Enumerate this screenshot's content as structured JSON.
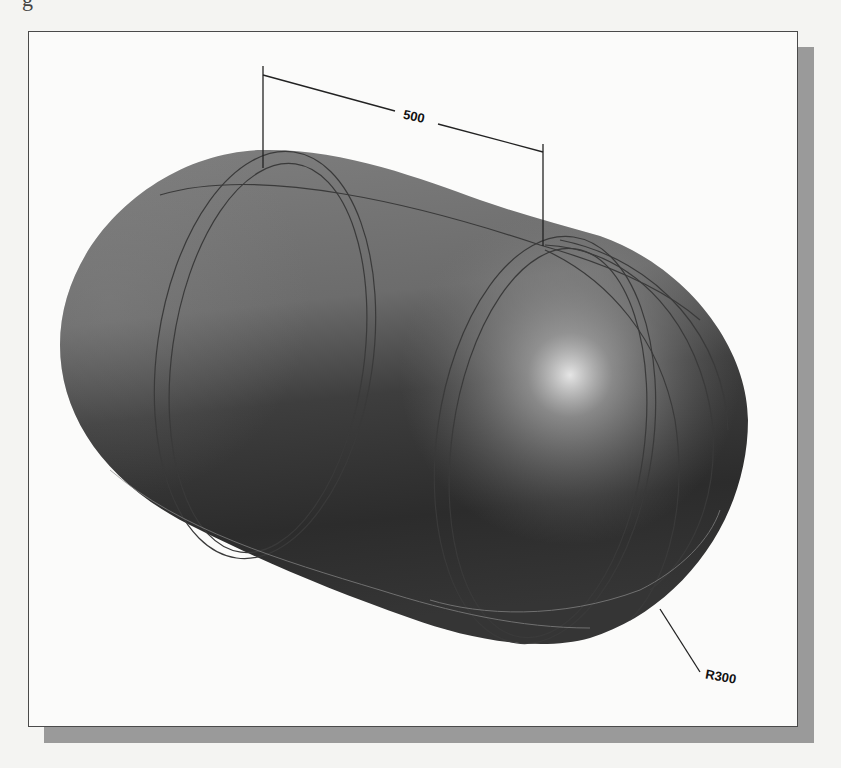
{
  "page": {
    "top_fragment_glyph": "g"
  },
  "figure": {
    "colors": {
      "background": "#f4f4f2",
      "frame_fill": "#fbfbfa",
      "frame_border": "#4a4a4a",
      "shadow": "#9a9a9a",
      "body_dark": "#2a2a2a",
      "body_mid": "#777777",
      "highlight": "#e6e6e6",
      "edge_lines": "#3a3a3a"
    },
    "dimensions": {
      "length_label": "500",
      "radius_label": "R300"
    }
  }
}
